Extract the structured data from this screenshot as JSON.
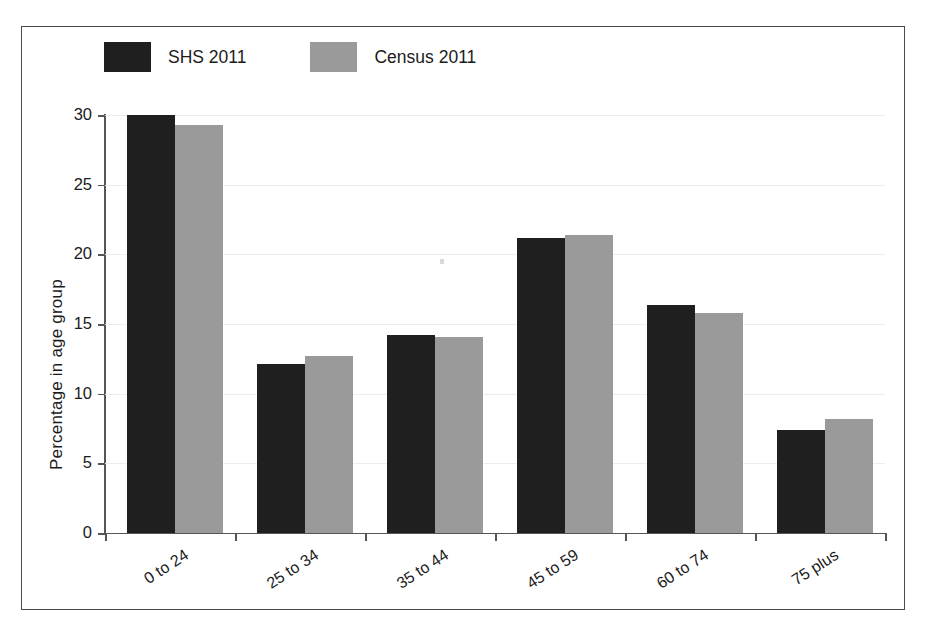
{
  "chart_data": {
    "type": "bar",
    "title": "",
    "xlabel": "",
    "ylabel": "Percentage in age group",
    "categories": [
      "0 to 24",
      "25 to 34",
      "35 to 44",
      "45 to 59",
      "60 to 74",
      "75 plus"
    ],
    "series": [
      {
        "name": "SHS 2011",
        "color": "#1f1f1f",
        "values": [
          30.0,
          12.1,
          14.2,
          21.2,
          16.4,
          7.4
        ]
      },
      {
        "name": "Census 2011",
        "color": "#9a9a9a",
        "values": [
          29.3,
          12.7,
          14.1,
          21.4,
          15.8,
          8.2
        ]
      }
    ],
    "ylim": [
      0,
      30
    ],
    "yticks": [
      0,
      5,
      10,
      15,
      20,
      25,
      30
    ],
    "ytick_labels": [
      "0",
      "5",
      "10",
      "15",
      "20",
      "25",
      "30"
    ],
    "grid": true,
    "grid_axis": "y",
    "legend_position": "top-left"
  },
  "legend": {
    "entries": [
      {
        "label": "SHS 2011"
      },
      {
        "label": "Census 2011"
      }
    ]
  },
  "axes": {
    "y_title": "Percentage in age group"
  }
}
